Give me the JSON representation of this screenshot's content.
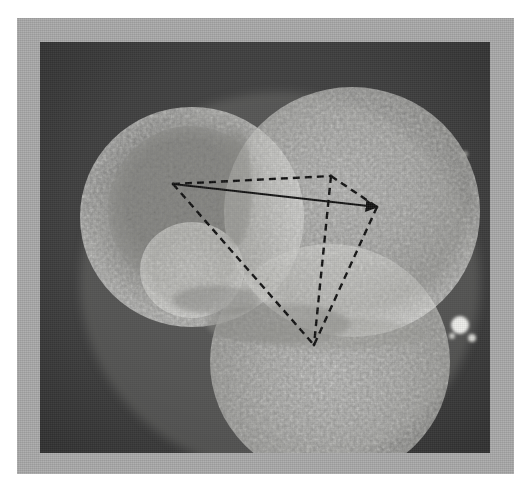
{
  "figure": {
    "kind": "electron-micrograph",
    "caption": "",
    "frame_color": "#a9a9a9",
    "field_color": "#3a3a3a",
    "page_background": "#ffffff",
    "overlay_color": "#101010"
  },
  "plate": {
    "frame": {
      "x": 17,
      "y": 18,
      "width": 497,
      "height": 456
    },
    "field": {
      "x": 40,
      "y": 42,
      "width": 450,
      "height": 411
    }
  },
  "specimen": {
    "description": "Cluster of four rough spherical particles",
    "particles": [
      {
        "name": "upper-left-sphere",
        "cx": 152,
        "cy": 175,
        "rx": 112,
        "ry": 110,
        "brightness": "medium",
        "core": "dark-textured"
      },
      {
        "name": "upper-right-sphere",
        "cx": 312,
        "cy": 170,
        "rx": 128,
        "ry": 125,
        "brightness": "bright"
      },
      {
        "name": "lower-sphere",
        "cx": 290,
        "cy": 320,
        "rx": 120,
        "ry": 118,
        "brightness": "bright"
      },
      {
        "name": "small-sphere",
        "cx": 152,
        "cy": 228,
        "rx": 52,
        "ry": 48,
        "brightness": "bright"
      }
    ],
    "debris": [
      {
        "name": "right-fleck",
        "cx": 420,
        "cy": 283,
        "r": 9
      },
      {
        "name": "right-fleck-small",
        "cx": 432,
        "cy": 296,
        "r": 4
      }
    ]
  },
  "overlay": {
    "shape": "tetrahedron",
    "line_color": "#101010",
    "solid_edge_width": 1.8,
    "dashed_edge_width": 2.4,
    "dash_pattern": "7 5",
    "vertices": [
      {
        "id": "A",
        "label": "left-vertex",
        "x": 173,
        "y": 184
      },
      {
        "id": "B",
        "label": "top-vertex",
        "x": 331,
        "y": 176
      },
      {
        "id": "C",
        "label": "right-vertex",
        "x": 377,
        "y": 207
      },
      {
        "id": "D",
        "label": "bottom-vertex",
        "x": 314,
        "y": 345
      }
    ],
    "edges": [
      {
        "from": "A",
        "to": "C",
        "style": "solid",
        "arrow": "end",
        "name": "edge-A-C"
      },
      {
        "from": "A",
        "to": "B",
        "style": "dashed",
        "arrow": "none",
        "name": "edge-A-B"
      },
      {
        "from": "B",
        "to": "C",
        "style": "dashed",
        "arrow": "none",
        "name": "edge-B-C"
      },
      {
        "from": "A",
        "to": "D",
        "style": "dashed",
        "arrow": "none",
        "name": "edge-A-D"
      },
      {
        "from": "B",
        "to": "D",
        "style": "dashed",
        "arrow": "none",
        "name": "edge-B-D"
      },
      {
        "from": "C",
        "to": "D",
        "style": "dashed",
        "arrow": "none",
        "name": "edge-C-D"
      }
    ]
  }
}
